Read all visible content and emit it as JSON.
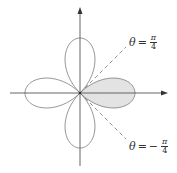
{
  "figure": {
    "type": "polar-rose-curve",
    "colors": {
      "axis": "#555555",
      "curve": "#7a7a7a",
      "shaded_fill": "#e3e3e3",
      "dashed_line": "#777777",
      "text": "#333333"
    },
    "origin": {
      "x": 80,
      "y": 93
    },
    "petal_length_px": 55,
    "petals": 4,
    "shaded_petal": "right"
  },
  "labels": {
    "upper": {
      "theta": "θ",
      "eq": "=",
      "sign": "",
      "num": "π",
      "den": "4"
    },
    "lower": {
      "theta": "θ",
      "eq": "=",
      "sign": "−",
      "num": "π",
      "den": "4"
    }
  }
}
